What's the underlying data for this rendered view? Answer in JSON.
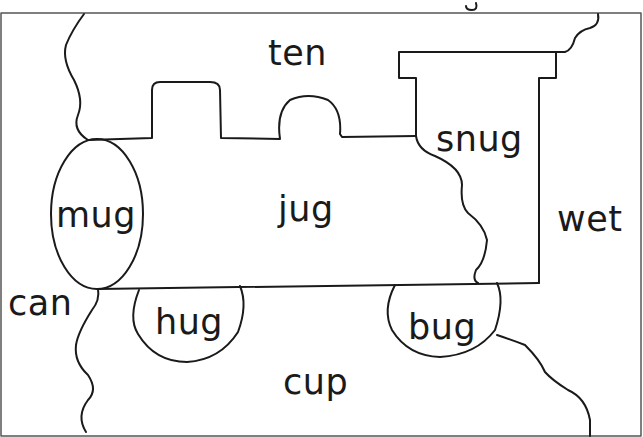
{
  "worksheet": {
    "type": "train jigsaw word sort",
    "words": {
      "ten": "ten",
      "snug": "snug",
      "mug": "mug",
      "jug": "jug",
      "wet": "wet",
      "can": "can",
      "hug": "hug",
      "bug": "bug",
      "cup": "cup"
    },
    "colors": {
      "ink": "#1a1a1a",
      "frame": "#555555",
      "background": "#ffffff"
    }
  }
}
